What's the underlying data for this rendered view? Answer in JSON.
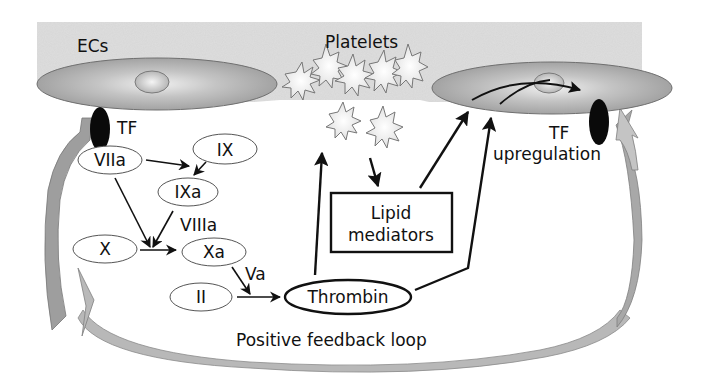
{
  "diagram": {
    "type": "biological-pathway",
    "colors": {
      "background": "#ffffff",
      "vessel_band": "#d9d9d9",
      "cell_fill": "#a8a8a8",
      "cell_highlight": "#ececec",
      "tf_fill": "#0a0a0a",
      "platelet_fill": "#f2f2f2",
      "feedback_arrow": "#a0a0a0",
      "ink": "#111111"
    }
  },
  "regions": {
    "endothelial_cells_label": "ECs",
    "platelets_label": "Platelets"
  },
  "labels": {
    "tf_left": "TF",
    "tf_right_line1": "TF",
    "tf_right_line2": "upregulation",
    "cofactor_viiia": "VIIIa",
    "cofactor_va": "Va",
    "bottom_caption": "Positive feedback loop"
  },
  "nodes": {
    "viia": "VIIa",
    "ix": "IX",
    "ixa": "IXa",
    "x": "X",
    "xa": "Xa",
    "ii": "II",
    "thrombin": "Thrombin",
    "lipid_line1": "Lipid",
    "lipid_line2": "mediators"
  },
  "edges": [
    {
      "from": "VIIa",
      "to": "IXa",
      "via": "arrow to IX conversion"
    },
    {
      "from": "IX",
      "to": "IXa"
    },
    {
      "from": "VIIa",
      "to": "Xa",
      "via": "X conversion"
    },
    {
      "from": "IXa",
      "to": "Xa",
      "cofactor": "VIIIa"
    },
    {
      "from": "X",
      "to": "Xa"
    },
    {
      "from": "Xa",
      "to": "Thrombin",
      "cofactor": "Va"
    },
    {
      "from": "II",
      "to": "Thrombin"
    },
    {
      "from": "Thrombin",
      "to": "Platelets"
    },
    {
      "from": "Platelets",
      "to": "Lipid mediators"
    },
    {
      "from": "Lipid mediators",
      "to": "ECs (right)"
    },
    {
      "from": "Thrombin",
      "to": "ECs (right)"
    },
    {
      "from": "ECs (right) nucleus",
      "to": "TF upregulation"
    },
    {
      "from": "TF upregulation",
      "to": "TF (left)",
      "label": "Positive feedback loop"
    }
  ]
}
